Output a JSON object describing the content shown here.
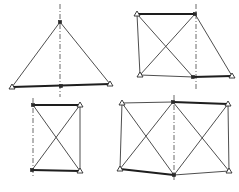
{
  "figure": {
    "width": 239,
    "height": 192,
    "background": "#ffffff",
    "line_color": "#3a3a3a",
    "panels": [
      {
        "id": "triangle-truss",
        "axis": {
          "x": 60,
          "y1": 4,
          "y2": 97
        },
        "nodes": {
          "apex": [
            60,
            22,
            "joint"
          ],
          "bl": [
            12,
            87,
            "pin"
          ],
          "bm": [
            61,
            86,
            "joint"
          ],
          "br": [
            110,
            84,
            "pin"
          ]
        },
        "members": [
          [
            "apex",
            "bl"
          ],
          [
            "apex",
            "br"
          ]
        ],
        "chords": [
          [
            "bl",
            "br"
          ]
        ]
      },
      {
        "id": "braced-trapezoid-truss",
        "axis": {
          "x": 196,
          "y1": 4,
          "y2": 90
        },
        "nodes": {
          "tl": [
            137,
            14,
            "pin"
          ],
          "tr": [
            195,
            14,
            "joint"
          ],
          "bl": [
            140,
            75,
            "pin"
          ],
          "bm": [
            193,
            77,
            "joint"
          ],
          "br": [
            232,
            76,
            "pin"
          ]
        },
        "members": [
          [
            "tl",
            "bl"
          ],
          [
            "tl",
            "bm"
          ],
          [
            "bl",
            "tr"
          ],
          [
            "tr",
            "br"
          ],
          [
            "bl",
            "bm"
          ]
        ],
        "chords": [
          [
            "tl",
            "tr"
          ],
          [
            "bm",
            "br"
          ]
        ]
      },
      {
        "id": "x-braced-panel",
        "axis": {
          "x": 33,
          "y1": 98,
          "y2": 178
        },
        "nodes": {
          "tl": [
            33,
            105,
            "joint"
          ],
          "tr": [
            80,
            105,
            "pin"
          ],
          "bl": [
            32,
            170,
            "joint"
          ],
          "br": [
            80,
            171,
            "pin"
          ]
        },
        "members": [
          [
            "tr",
            "br"
          ],
          [
            "tl",
            "br"
          ],
          [
            "tr",
            "bl"
          ]
        ],
        "chords": [
          [
            "tl",
            "tr"
          ],
          [
            "bl",
            "br"
          ]
        ]
      },
      {
        "id": "double-x-braced-truss",
        "axis": {
          "x": 174,
          "y1": 95,
          "y2": 180
        },
        "nodes": {
          "tl": [
            122,
            103,
            "pin"
          ],
          "tm": [
            173,
            102,
            "joint"
          ],
          "tr": [
            228,
            104,
            "pin"
          ],
          "bl": [
            120,
            169,
            "pin"
          ],
          "bm": [
            174,
            175,
            "joint"
          ],
          "br": [
            229,
            171,
            "pin"
          ]
        },
        "members": [
          [
            "tl",
            "tm"
          ],
          [
            "tl",
            "bl"
          ],
          [
            "tl",
            "bm"
          ],
          [
            "bl",
            "tm"
          ],
          [
            "tm",
            "br"
          ],
          [
            "bm",
            "tr"
          ],
          [
            "tr",
            "br"
          ],
          [
            "bm",
            "br"
          ]
        ],
        "chords": [
          [
            "tm",
            "tr"
          ],
          [
            "bl",
            "bm"
          ]
        ]
      }
    ]
  }
}
